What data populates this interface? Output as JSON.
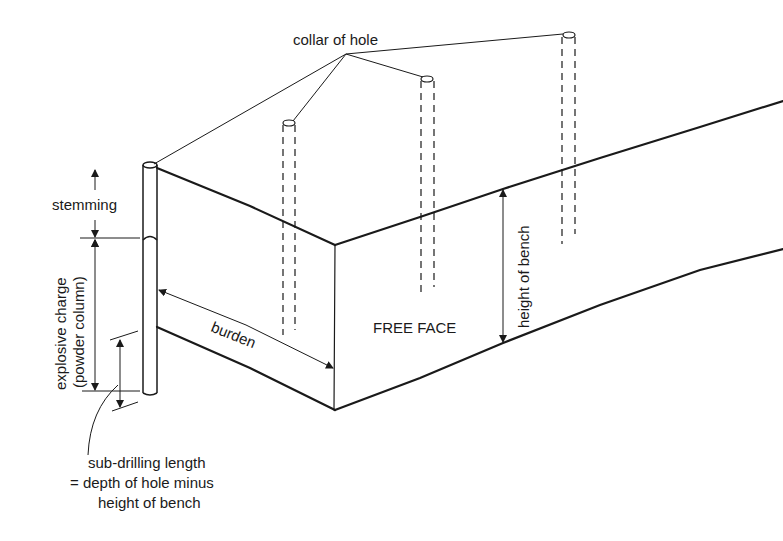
{
  "diagram": {
    "type": "bench blasting cross-section",
    "labels": {
      "collar": "collar of hole",
      "stemming": "stemming",
      "charge_line1": "explosive charge",
      "charge_line2": "(powder column)",
      "burden": "burden",
      "free_face": "FREE FACE",
      "height_of_bench": "height of bench",
      "subdrill_line1": "sub-drilling length",
      "subdrill_line2": "= depth of hole minus",
      "subdrill_line3": "height of bench"
    },
    "colors": {
      "ink": "#1a1a1a",
      "background": "#ffffff"
    }
  }
}
